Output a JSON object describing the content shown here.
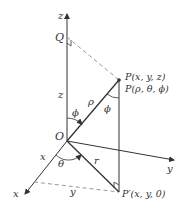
{
  "diagram": {
    "colors": {
      "line": "#333333",
      "dashed": "#999999",
      "background": "#ffffff"
    },
    "axes": {
      "z": "z",
      "x": "x",
      "y": "y"
    },
    "points": {
      "origin": "O",
      "q": "Q",
      "p_cartesian": "P(x, y, z)",
      "p_spherical": "P(ρ, θ, ϕ)",
      "p_prime": "P′(x, y, 0)"
    },
    "segment_labels": {
      "z_height": "z",
      "rho": "ρ",
      "r": "r",
      "x_length": "x",
      "y_length": "y"
    },
    "angle_labels": {
      "phi_at_origin": "ϕ",
      "phi_at_p": "ϕ",
      "theta": "θ"
    }
  }
}
